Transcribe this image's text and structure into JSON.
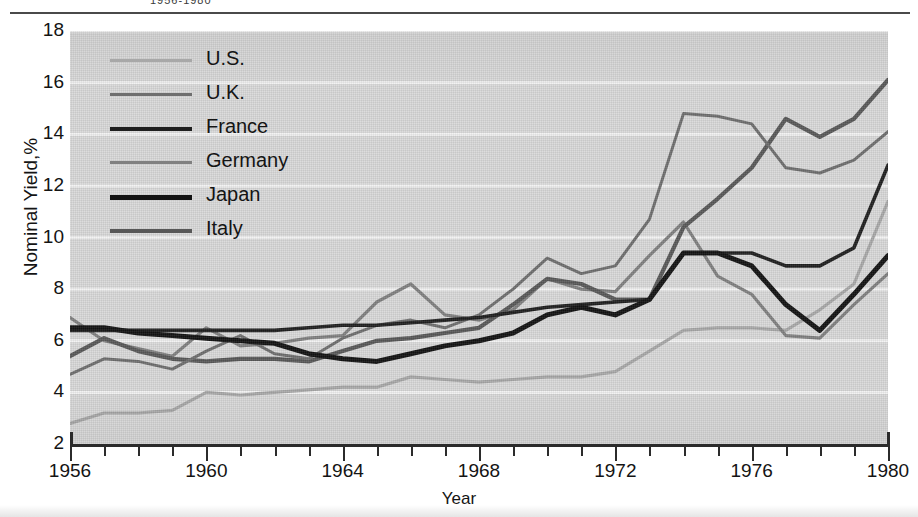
{
  "figure": {
    "clipped_caption": "1956-1980",
    "x_axis_title": "Year",
    "y_axis_title": "Nominal Yield,%"
  },
  "legend": {
    "entries": [
      {
        "label": "U.S.",
        "color": "#a8a8a8",
        "width": 3.2
      },
      {
        "label": "U.K.",
        "color": "#6e6e6e",
        "width": 3.0
      },
      {
        "label": "France",
        "color": "#1f1f1f",
        "width": 3.6
      },
      {
        "label": "Germany",
        "color": "#808080",
        "width": 3.2
      },
      {
        "label": "Japan",
        "color": "#121212",
        "width": 5.0
      },
      {
        "label": "Italy",
        "color": "#585858",
        "width": 4.2
      }
    ]
  },
  "axes": {
    "y_ticks": [
      18,
      16,
      14,
      12,
      10,
      8,
      6,
      4,
      2
    ],
    "x_major_ticks": [
      1956,
      1960,
      1964,
      1968,
      1972,
      1976,
      1980
    ],
    "x_minor_step": 1,
    "xlim": [
      1956,
      1980
    ],
    "ylim": [
      2,
      18
    ]
  },
  "chart_data": {
    "type": "line",
    "title": "1956-1980",
    "xlabel": "Year",
    "ylabel": "Nominal Yield,%",
    "xlim": [
      1956,
      1980
    ],
    "ylim": [
      2,
      18
    ],
    "grid": "horizontal",
    "legend_position": "upper-left-inside",
    "x": [
      1956,
      1957,
      1958,
      1959,
      1960,
      1961,
      1962,
      1963,
      1964,
      1965,
      1966,
      1967,
      1968,
      1969,
      1970,
      1971,
      1972,
      1973,
      1974,
      1975,
      1976,
      1977,
      1978,
      1979,
      1980
    ],
    "series": [
      {
        "name": "U.S.",
        "color": "#a8a8a8",
        "values": [
          2.8,
          3.2,
          3.2,
          3.3,
          4.0,
          3.9,
          4.0,
          4.1,
          4.2,
          4.2,
          4.6,
          4.5,
          4.4,
          4.5,
          4.6,
          4.6,
          4.8,
          5.6,
          6.4,
          6.5,
          6.5,
          6.4,
          7.2,
          8.2,
          11.4
        ]
      },
      {
        "name": "U.K.",
        "color": "#6e6e6e",
        "values": [
          4.7,
          5.3,
          5.2,
          4.9,
          5.6,
          6.2,
          5.5,
          5.3,
          6.1,
          6.6,
          6.8,
          6.5,
          7.0,
          8.0,
          9.2,
          8.6,
          8.9,
          10.7,
          14.8,
          14.7,
          14.4,
          12.7,
          12.5,
          13.0,
          14.1
        ]
      },
      {
        "name": "France",
        "color": "#1f1f1f",
        "values": [
          6.4,
          6.4,
          6.4,
          6.4,
          6.4,
          6.4,
          6.4,
          6.5,
          6.6,
          6.6,
          6.7,
          6.8,
          6.9,
          7.1,
          7.3,
          7.4,
          7.5,
          7.6,
          9.4,
          9.4,
          9.4,
          8.9,
          8.9,
          9.6,
          12.8
        ]
      },
      {
        "name": "Germany",
        "color": "#808080",
        "values": [
          6.9,
          6.0,
          5.7,
          5.4,
          6.5,
          5.8,
          5.9,
          6.1,
          6.2,
          7.5,
          8.2,
          7.0,
          6.8,
          7.2,
          8.4,
          8.0,
          7.9,
          9.3,
          10.6,
          8.5,
          7.8,
          6.2,
          6.1,
          7.4,
          8.6
        ]
      },
      {
        "name": "Japan",
        "color": "#121212",
        "values": [
          6.5,
          6.5,
          6.3,
          6.2,
          6.1,
          6.0,
          5.9,
          5.5,
          5.3,
          5.2,
          5.5,
          5.8,
          6.0,
          6.3,
          7.0,
          7.3,
          7.0,
          7.6,
          9.4,
          9.4,
          8.9,
          7.4,
          6.4,
          7.8,
          9.3
        ]
      },
      {
        "name": "Italy",
        "color": "#585858",
        "values": [
          5.4,
          6.1,
          5.6,
          5.3,
          5.2,
          5.3,
          5.3,
          5.2,
          5.6,
          6.0,
          6.1,
          6.3,
          6.5,
          7.4,
          8.4,
          8.2,
          7.6,
          7.6,
          10.4,
          11.5,
          12.7,
          14.6,
          13.9,
          14.6,
          16.1
        ]
      }
    ]
  }
}
